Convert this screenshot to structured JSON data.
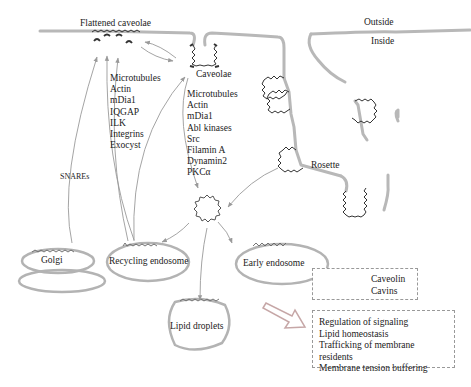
{
  "labels": {
    "flattened_caveolae": "Flattened caveolae",
    "caveolae": "Caveolae",
    "outside": "Outside",
    "inside": "Inside",
    "rosette": "Rosette",
    "snares": "SNAREs",
    "golgi": "Golgi",
    "recycling_endosome": "Recycling endosome",
    "early_endosome": "Early endosome",
    "lipid_droplets": "Lipid droplets"
  },
  "factors_flattening": [
    "Microtubules",
    "Actin",
    "mDia1",
    "IQGAP",
    "ILK",
    "Integrins",
    "Exocyst"
  ],
  "factors_internalization": [
    "Microtubules",
    "Actin",
    "mDia1",
    "Abl kinases",
    "Src",
    "Filamin A",
    "Dynamin2",
    "PKCα"
  ],
  "legend": {
    "items": [
      {
        "icon": "caveolin-wave",
        "label": "Caveolin"
      },
      {
        "icon": "cavin-mark",
        "label": "Cavins"
      }
    ]
  },
  "functions": [
    "Regulation of signaling",
    "Lipid homeostasis",
    "Trafficking of membrane residents",
    "Membrane tension buffering"
  ],
  "colors": {
    "membrane": "#b3b3b3",
    "caveolin": "#333333",
    "arrow": "#9a9a9a",
    "text": "#222222",
    "legend_border": "#999999"
  }
}
